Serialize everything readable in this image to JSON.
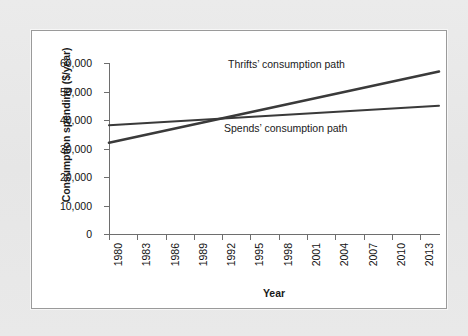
{
  "figure": {
    "background_color": "#e9e9e9",
    "panel_color": "#ffffff",
    "line_color": "#3a3a3a",
    "axis_color": "#6e6e6e"
  },
  "chart_data": {
    "type": "line",
    "title": "",
    "xlabel": "Year",
    "ylabel": "Consumption spending ($/year)",
    "xlim": [
      1980,
      2015
    ],
    "ylim": [
      0,
      60000
    ],
    "grid": false,
    "legend_position": "inline-annotations",
    "ytick_labels": [
      "60,000",
      "50,000",
      "40,000",
      "30,000",
      "20,000",
      "10,000",
      "0"
    ],
    "ytick_values": [
      60000,
      50000,
      40000,
      30000,
      20000,
      10000,
      0
    ],
    "xtick_labels": [
      "1980",
      "1983",
      "1986",
      "1989",
      "1992",
      "1995",
      "1998",
      "2001",
      "2004",
      "2007",
      "2010",
      "2013"
    ],
    "xtick_values": [
      1980,
      1983,
      1986,
      1989,
      1992,
      1995,
      1998,
      2001,
      2004,
      2007,
      2010,
      2013
    ],
    "series": [
      {
        "name": "Thrifts' consumption path",
        "annotation": "Thrifts’ consumption path",
        "x": [
          1980,
          2015
        ],
        "values": [
          32000,
          57000
        ]
      },
      {
        "name": "Spends' consumption path",
        "annotation": "Spends’ consumption path",
        "x": [
          1980,
          2015
        ],
        "values": [
          38200,
          45000
        ]
      }
    ],
    "annotations": [
      {
        "text": "Thrifts’ consumption path",
        "series": "Thrifts' consumption path"
      },
      {
        "text": "Spends’ consumption path",
        "series": "Spends' consumption path"
      }
    ],
    "crossover": {
      "year": 1994.5,
      "value": 40800
    }
  }
}
